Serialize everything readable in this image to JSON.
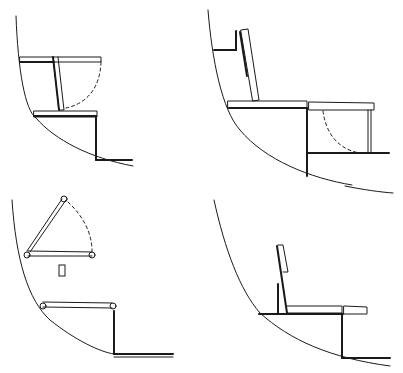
{
  "diagram": {
    "panels": [
      {
        "id": "top-left",
        "label": "Folding seat lowered, step below"
      },
      {
        "id": "top-right",
        "label": "Backrest against hull, extended seat with folding leg"
      },
      {
        "id": "bottom-left",
        "label": "Hinged frame/bunk mechanism"
      },
      {
        "id": "bottom-right",
        "label": "Bench with upright backrest and extension"
      }
    ],
    "colors": {
      "ink": "#1a1a1a",
      "background": "#ffffff"
    }
  }
}
